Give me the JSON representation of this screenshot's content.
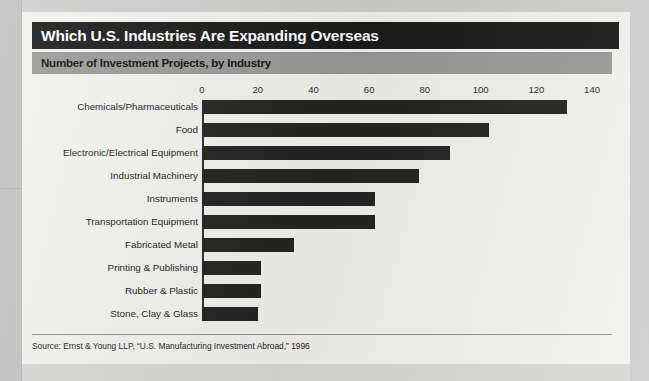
{
  "header": {
    "title": "Which U.S. Industries Are Expanding Overseas",
    "subtitle": "Number of Investment Projects, by Industry"
  },
  "source": {
    "text": "Source: Ernst & Young LLP, “U.S. Manufacturing Investment Abroad,” 1996"
  },
  "colors": {
    "title_bar": "#1a1a1a",
    "title_text": "#ffffff",
    "subtitle_bar": "#9a9a9a",
    "bar_fill": "#232323",
    "card_background": "#f2f2ef",
    "page_background": "#cfcfcf"
  },
  "chart_data": {
    "type": "bar",
    "orientation": "horizontal",
    "title": "Which U.S. Industries Are Expanding Overseas",
    "subtitle": "Number of Investment Projects, by Industry",
    "xlabel": "",
    "ylabel": "",
    "xlim": [
      0,
      140
    ],
    "xticks": [
      0,
      20,
      40,
      60,
      80,
      100,
      120,
      140
    ],
    "tick_labels": [
      "0",
      "20",
      "40",
      "60",
      "80",
      "100",
      "120",
      "140"
    ],
    "grid": false,
    "legend": null,
    "categories": [
      "Chemicals/Pharmaceuticals",
      "Food",
      "Electronic/Electrical Equipment",
      "Industrial Machinery",
      "Instruments",
      "Transportation Equipment",
      "Fabricated Metal",
      "Printing & Publishing",
      "Rubber & Plastic",
      "Stone, Clay & Glass"
    ],
    "values": [
      131,
      103,
      89,
      78,
      62,
      62,
      33,
      21,
      21,
      20
    ],
    "source": "Source: Ernst & Young LLP, “U.S. Manufacturing Investment Abroad,” 1996"
  }
}
